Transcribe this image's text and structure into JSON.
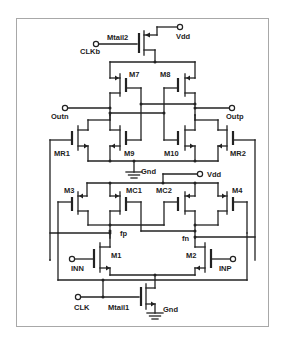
{
  "diagram": {
    "type": "circuit-schematic",
    "title": "",
    "transistors": [
      {
        "id": "Mtail2",
        "label": "Mtail2",
        "kind": "pmos"
      },
      {
        "id": "M7",
        "label": "M7",
        "kind": "pmos"
      },
      {
        "id": "M8",
        "label": "M8",
        "kind": "pmos"
      },
      {
        "id": "MR1",
        "label": "MR1",
        "kind": "nmos"
      },
      {
        "id": "M9",
        "label": "M9",
        "kind": "nmos"
      },
      {
        "id": "M10",
        "label": "M10",
        "kind": "nmos"
      },
      {
        "id": "MR2",
        "label": "MR2",
        "kind": "nmos"
      },
      {
        "id": "M3",
        "label": "M3",
        "kind": "pmos"
      },
      {
        "id": "MC1",
        "label": "MC1",
        "kind": "pmos"
      },
      {
        "id": "MC2",
        "label": "MC2",
        "kind": "pmos"
      },
      {
        "id": "M4",
        "label": "M4",
        "kind": "pmos"
      },
      {
        "id": "M1",
        "label": "M1",
        "kind": "nmos"
      },
      {
        "id": "M2",
        "label": "M2",
        "kind": "nmos"
      },
      {
        "id": "Mtail1",
        "label": "Mtail1",
        "kind": "nmos"
      }
    ],
    "terminals": {
      "vdd_top": "Vdd",
      "clkb": "CLKb",
      "outn": "Outn",
      "outp": "Outp",
      "gnd_mid": "Gnd",
      "vdd_mid": "Vdd",
      "inn": "INN",
      "inp": "INP",
      "clk": "CLK",
      "gnd_bottom": "Gnd"
    },
    "nodes": {
      "fp": "fp",
      "fn": "fn"
    },
    "colors": {
      "wire": "#222222",
      "frame": "#a8a8a8",
      "background": "#ffffff"
    }
  }
}
